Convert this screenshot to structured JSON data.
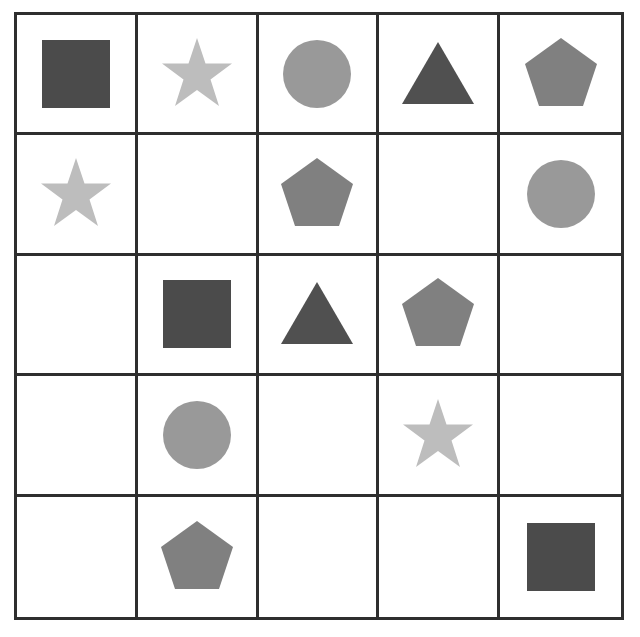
{
  "grid": {
    "rows": 5,
    "cols": 5,
    "cells": [
      [
        "square",
        "star",
        "circle",
        "triangle",
        "pentagon"
      ],
      [
        "star",
        "",
        "pentagon",
        "",
        "circle"
      ],
      [
        "",
        "square",
        "triangle",
        "pentagon",
        ""
      ],
      [
        "",
        "circle",
        "",
        "star",
        ""
      ],
      [
        "",
        "pentagon",
        "",
        "",
        "square"
      ]
    ]
  },
  "shape_colors": {
    "square": "#4b4b4b",
    "star": "#bdbdbd",
    "circle": "#999999",
    "triangle": "#505050",
    "pentagon": "#808080"
  },
  "line_color": "#2e2e2e"
}
